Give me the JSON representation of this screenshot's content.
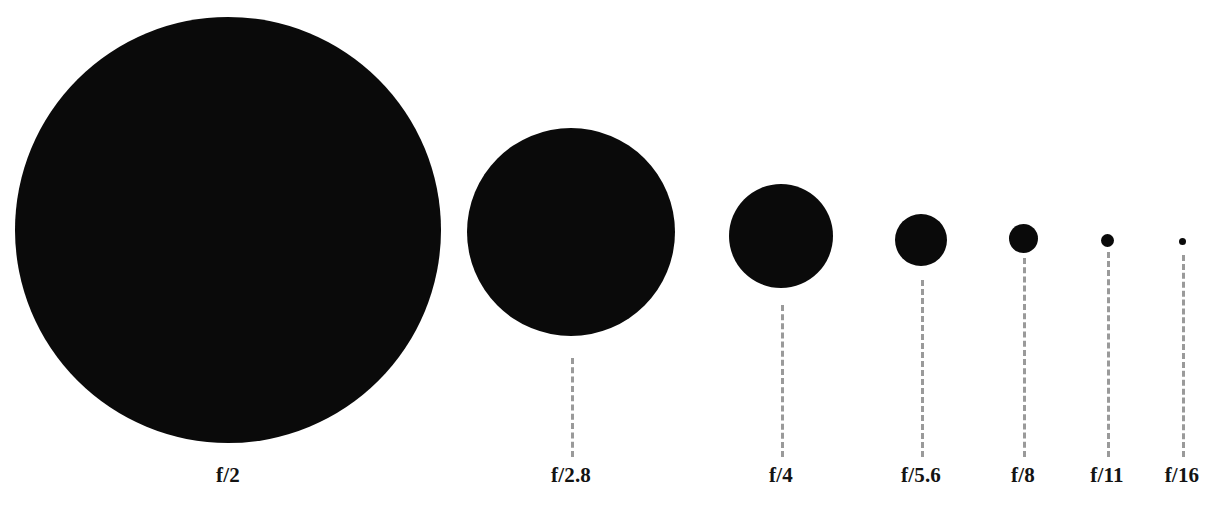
{
  "figure": {
    "width": 1220,
    "height": 516,
    "background_color": "#ffffff",
    "disc_color": "#0a0a0a",
    "leader_color": "#9a9a9a",
    "label_color": "#131313"
  },
  "chart_data": {
    "type": "scatter",
    "title": "",
    "subtitle": "",
    "xlabel": "",
    "ylabel": "",
    "grid": false,
    "legend": null,
    "annotations": [],
    "categories": [
      "f/2",
      "f/2.8",
      "f/4",
      "f/5.6",
      "f/8",
      "f/11",
      "f/16"
    ],
    "f_numbers": [
      2,
      2.8,
      4,
      5.6,
      8,
      11,
      16
    ],
    "values": [
      426,
      208,
      104,
      52,
      29,
      13,
      7
    ],
    "value_unit": "px diameter",
    "relative_diameter": [
      1.0,
      0.488,
      0.244,
      0.122,
      0.068,
      0.031,
      0.016
    ],
    "points": [
      {
        "label": "f/2",
        "f_number": 2,
        "diameter": 426,
        "cx": 228,
        "cy": 230,
        "leader_from": 0,
        "leader_to": 0,
        "has_leader": false,
        "label_x": 228,
        "label_y": 465
      },
      {
        "label": "f/2.8",
        "f_number": 2.8,
        "diameter": 208,
        "cx": 571,
        "cy": 232,
        "leader_from": 358,
        "leader_to": 457,
        "has_leader": true,
        "label_x": 571,
        "label_y": 465
      },
      {
        "label": "f/4",
        "f_number": 4,
        "diameter": 104,
        "cx": 781,
        "cy": 236,
        "leader_from": 305,
        "leader_to": 457,
        "has_leader": true,
        "label_x": 781,
        "label_y": 465
      },
      {
        "label": "f/5.6",
        "f_number": 5.6,
        "diameter": 52,
        "cx": 921,
        "cy": 240,
        "leader_from": 280,
        "leader_to": 457,
        "has_leader": true,
        "label_x": 921,
        "label_y": 465
      },
      {
        "label": "f/8",
        "f_number": 8,
        "diameter": 29,
        "cx": 1023,
        "cy": 238,
        "leader_from": 258,
        "leader_to": 457,
        "has_leader": true,
        "label_x": 1023,
        "label_y": 465
      },
      {
        "label": "f/11",
        "f_number": 11,
        "diameter": 13,
        "cx": 1107,
        "cy": 240,
        "leader_from": 252,
        "leader_to": 457,
        "has_leader": true,
        "label_x": 1107,
        "label_y": 465
      },
      {
        "label": "f/16",
        "f_number": 16,
        "diameter": 7,
        "cx": 1182,
        "cy": 241,
        "leader_from": 255,
        "leader_to": 457,
        "has_leader": true,
        "label_x": 1182,
        "label_y": 465
      }
    ]
  }
}
